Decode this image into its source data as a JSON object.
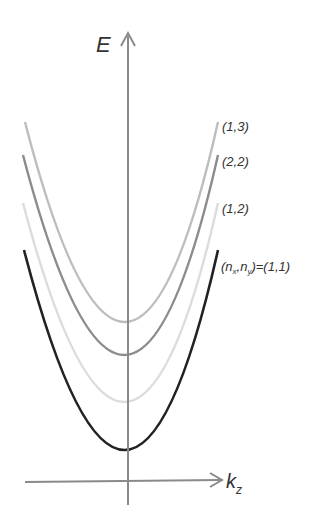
{
  "diagram": {
    "y_axis_label": "E",
    "x_axis_label_main": "k",
    "x_axis_label_sub": "z",
    "axis_color": "#8a8a8a",
    "bands": [
      {
        "label": "(1,3)",
        "color": "#bdbdbd",
        "min_y": 322,
        "top_y": 122
      },
      {
        "label": "(2,2)",
        "color": "#8c8c8c",
        "min_y": 355,
        "top_y": 155
      },
      {
        "label": "(1,2)",
        "color": "#dcdcdc",
        "min_y": 402,
        "top_y": 203
      },
      {
        "label_parts": [
          "(n",
          "x",
          ",n",
          "y",
          ")=(1,1)"
        ],
        "color": "#222222",
        "min_y": 450,
        "top_y": 250
      }
    ],
    "labels": {
      "b13": "(1,3)",
      "b22": "(2,2)",
      "b12": "(1,2)",
      "b11_a": "(n",
      "b11_b": "x",
      "b11_c": ",n",
      "b11_d": "y",
      "b11_e": ")=(1,1)"
    }
  }
}
